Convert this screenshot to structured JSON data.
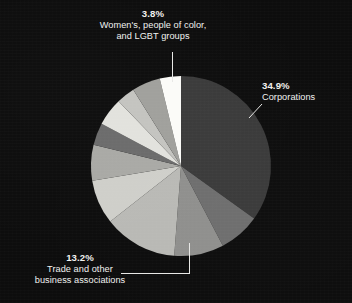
{
  "figure": {
    "background_color": "#0d0d0d",
    "text_color": "#f2f2f0",
    "leader_color": "#e8e8e6"
  },
  "chart_data": {
    "type": "pie",
    "title": "",
    "subtitle": "",
    "xlabel": "",
    "ylabel": "",
    "legend_position": "none",
    "grid": false,
    "start_angle_deg": 90,
    "direction": "clockwise",
    "center": {
      "cx": 181,
      "cy": 166,
      "r": 90
    },
    "categories": [
      "Corporations",
      "Slice 2",
      "Slice 3",
      "Trade and other business associations",
      "Slice 5",
      "Slice 6",
      "Slice 7",
      "Slice 8",
      "Slice 9",
      "Slice 10",
      "Women's, people of color, and LGBT groups"
    ],
    "values": [
      34.9,
      7.4,
      8.9,
      13.2,
      8.0,
      6.4,
      4.0,
      5.0,
      3.3,
      5.1,
      3.8
    ],
    "colors": [
      "#3a3a3a",
      "#6e6e6e",
      "#8f8f8d",
      "#b9b9b5",
      "#cfcfca",
      "#a9a9a5",
      "#6b6b6b",
      "#e2e2dd",
      "#c4c4c0",
      "#a0a09c",
      "#fbfbf8"
    ],
    "labeled_slices": [
      {
        "name": "Corporations",
        "percent": "34.9%",
        "label": "Corporations"
      },
      {
        "name": "Trade and other business associations",
        "percent": "13.2%",
        "label": "Trade and other business associations"
      },
      {
        "name": "Women's, people of color, and LGBT groups",
        "percent": "3.8%",
        "label": "Women's, people of color, and LGBT groups"
      }
    ]
  },
  "labels": {
    "women": {
      "percent": "3.8%",
      "line1": "Women's, people of color,",
      "line2": "and LGBT groups"
    },
    "corporations": {
      "percent": "34.9%",
      "line1": "Corporations"
    },
    "trade": {
      "percent": "13.2%",
      "line1": "Trade and other",
      "line2": "business associations"
    }
  }
}
